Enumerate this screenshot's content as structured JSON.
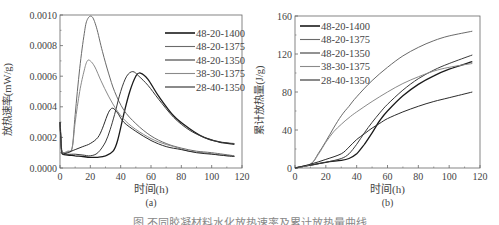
{
  "caption": "图 不同胶凝材料水化放热速率及累计放热量曲线",
  "chart_data": [
    {
      "id": "a",
      "type": "line",
      "panel_label": "(a)",
      "title": "",
      "xlabel": "时间(h)",
      "ylabel": "放热速率(mW/g)",
      "xlim": [
        0,
        120
      ],
      "ylim": [
        0,
        0.001
      ],
      "xticks": [
        "0",
        "20",
        "40",
        "60",
        "80",
        "100",
        "120"
      ],
      "yticks": [
        "0.0000",
        "0.0002",
        "0.0004",
        "0.0006",
        "0.0008",
        "0.0010"
      ],
      "legend_position": "upper right",
      "grid": false,
      "series": [
        {
          "name": "48-20-1400",
          "color": "#1a1a1a",
          "x": [
            0,
            1,
            2,
            5,
            10,
            15,
            20,
            25,
            30,
            35,
            38,
            42,
            46,
            50,
            53,
            58,
            65,
            75,
            85,
            95,
            105,
            115
          ],
          "y": [
            0.0003,
            0.00012,
            9e-05,
            8.5e-05,
            8e-05,
            7.5e-05,
            7e-05,
            7e-05,
            8e-05,
            0.00011,
            0.00018,
            0.00035,
            0.0005,
            0.0006,
            0.00062,
            0.00058,
            0.00047,
            0.00034,
            0.00026,
            0.0002,
            0.00017,
            0.000155
          ]
        },
        {
          "name": "48-20-1375",
          "color": "#6a6a6a",
          "x": [
            0,
            1,
            2,
            5,
            8,
            10,
            13,
            16,
            18,
            21,
            24,
            28,
            32,
            36,
            42,
            50,
            60,
            70,
            80,
            90,
            100,
            115
          ],
          "y": [
            0.0003,
            0.00012,
            0.0001,
            0.000105,
            0.00013,
            0.00035,
            0.00065,
            0.00088,
            0.00097,
            0.00099,
            0.00092,
            0.00076,
            0.00062,
            0.0005,
            0.00038,
            0.00029,
            0.00021,
            0.00016,
            0.00013,
            0.00011,
            0.0001,
            8e-05
          ]
        },
        {
          "name": "48-20-1350",
          "color": "#3a3a3a",
          "x": [
            0,
            1,
            2,
            5,
            10,
            15,
            20,
            25,
            30,
            33,
            36,
            40,
            44,
            48,
            52,
            58,
            65,
            75,
            85,
            95,
            105,
            115
          ],
          "y": [
            0.0003,
            0.00012,
            0.0001,
            9e-05,
            9e-05,
            8.5e-05,
            8e-05,
            0.0001,
            0.00017,
            0.00025,
            0.00035,
            0.0005,
            0.0006,
            0.00063,
            0.0006,
            0.00054,
            0.00045,
            0.00033,
            0.00025,
            0.0002,
            0.00017,
            0.00016
          ]
        },
        {
          "name": "38-30-1375",
          "color": "#8a8a8a",
          "x": [
            0,
            1,
            2,
            5,
            8,
            10,
            13,
            16,
            18,
            20,
            23,
            27,
            32,
            38,
            45,
            55,
            65,
            75,
            85,
            95,
            105,
            115
          ],
          "y": [
            0.0003,
            0.00012,
            0.0001,
            0.00011,
            0.00013,
            0.0003,
            0.0005,
            0.00064,
            0.0007,
            0.0007,
            0.00066,
            0.00057,
            0.00047,
            0.00037,
            0.00029,
            0.00022,
            0.00017,
            0.00014,
            0.00011,
            0.0001,
            8.5e-05,
            7.5e-05
          ]
        },
        {
          "name": "28-40-1350",
          "color": "#2a2a2a",
          "x": [
            0,
            1,
            2,
            5,
            10,
            15,
            20,
            25,
            28,
            31,
            33,
            35,
            38,
            42,
            50,
            60,
            70,
            80,
            90,
            100,
            110,
            115
          ],
          "y": [
            0.0003,
            0.00012,
            9e-05,
            0.0001,
            0.00012,
            0.00014,
            0.00016,
            0.0002,
            0.00026,
            0.00034,
            0.00038,
            0.00039,
            0.00036,
            0.0003,
            0.00024,
            0.00018,
            0.00014,
            0.00012,
            0.0001,
            9e-05,
            8e-05,
            7.5e-05
          ]
        }
      ]
    },
    {
      "id": "b",
      "type": "line",
      "panel_label": "(b)",
      "title": "",
      "xlabel": "时间(h)",
      "ylabel": "累计放热量(J/g)",
      "xlim": [
        0,
        120
      ],
      "ylim": [
        0,
        160
      ],
      "xticks": [
        "0",
        "20",
        "40",
        "60",
        "80",
        "100",
        "120"
      ],
      "yticks": [
        "0",
        "40",
        "80",
        "120",
        "160"
      ],
      "legend_position": "upper left",
      "grid": false,
      "series": [
        {
          "name": "48-20-1400",
          "color": "#1a1a1a",
          "x": [
            0,
            10,
            20,
            30,
            35,
            40,
            45,
            50,
            55,
            60,
            70,
            80,
            90,
            100,
            115
          ],
          "y": [
            0,
            3,
            6,
            8,
            10,
            15,
            25,
            37,
            50,
            60,
            76,
            88,
            97,
            104,
            112
          ]
        },
        {
          "name": "48-20-1375",
          "color": "#6a6a6a",
          "x": [
            0,
            10,
            15,
            20,
            25,
            30,
            35,
            40,
            50,
            60,
            70,
            80,
            90,
            100,
            115
          ],
          "y": [
            0,
            4,
            15,
            28,
            42,
            55,
            65,
            75,
            92,
            106,
            118,
            127,
            134,
            139,
            144
          ]
        },
        {
          "name": "48-20-1350",
          "color": "#3a3a3a",
          "x": [
            0,
            10,
            20,
            30,
            35,
            40,
            45,
            50,
            55,
            60,
            70,
            80,
            90,
            100,
            115
          ],
          "y": [
            0,
            3,
            6,
            10,
            15,
            25,
            37,
            48,
            58,
            67,
            82,
            94,
            103,
            110,
            119
          ]
        },
        {
          "name": "38-30-1375",
          "color": "#8a8a8a",
          "x": [
            0,
            10,
            15,
            20,
            25,
            30,
            35,
            40,
            50,
            60,
            70,
            80,
            90,
            100,
            115
          ],
          "y": [
            0,
            4,
            14,
            27,
            38,
            46,
            53,
            59,
            70,
            80,
            89,
            96,
            102,
            106,
            110
          ]
        },
        {
          "name": "28-40-1350",
          "color": "#2a2a2a",
          "x": [
            0,
            10,
            20,
            30,
            35,
            40,
            45,
            50,
            55,
            60,
            70,
            80,
            90,
            100,
            115
          ],
          "y": [
            0,
            4,
            9,
            15,
            22,
            30,
            36,
            42,
            47,
            52,
            59,
            65,
            70,
            74,
            80
          ]
        }
      ]
    }
  ]
}
